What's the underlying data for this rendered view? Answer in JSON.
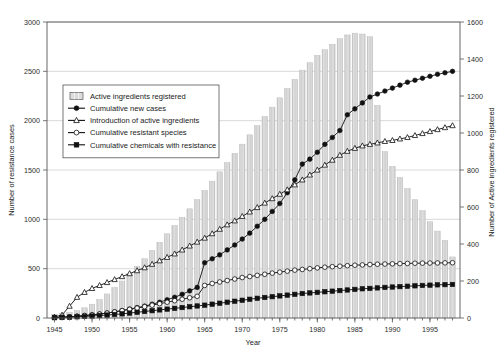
{
  "chart_data": {
    "type": "bar",
    "title": "",
    "xlabel": "Year",
    "ylabel": "Number of resistance cases",
    "y2label": "Number of Active ingredients registered",
    "xlim": [
      1944,
      1999
    ],
    "ylim": [
      0,
      3000
    ],
    "y2lim": [
      0,
      1600
    ],
    "grid": true,
    "legend_position": "upper-left-inside",
    "x_ticks": [
      "1945",
      "1950",
      "1955",
      "1960",
      "1965",
      "1970",
      "1975",
      "1980",
      "1985",
      "1990",
      "1995"
    ],
    "x_tick_values": [
      1945,
      1950,
      1955,
      1960,
      1965,
      1970,
      1975,
      1980,
      1985,
      1990,
      1995
    ],
    "y_ticks": [
      "0",
      "500",
      "1000",
      "1500",
      "2000",
      "2500",
      "3000"
    ],
    "y_tick_values": [
      0,
      500,
      1000,
      1500,
      2000,
      2500,
      3000
    ],
    "y2_ticks": [
      "0",
      "200",
      "400",
      "600",
      "800",
      "1000",
      "1200",
      "1400",
      "1600"
    ],
    "y2_tick_values": [
      0,
      200,
      400,
      600,
      800,
      1000,
      1200,
      1400,
      1600
    ],
    "x": [
      1945,
      1946,
      1947,
      1948,
      1949,
      1950,
      1951,
      1952,
      1953,
      1954,
      1955,
      1956,
      1957,
      1958,
      1959,
      1960,
      1961,
      1962,
      1963,
      1964,
      1965,
      1966,
      1967,
      1968,
      1969,
      1970,
      1971,
      1972,
      1973,
      1974,
      1975,
      1976,
      1977,
      1978,
      1979,
      1980,
      1981,
      1982,
      1983,
      1984,
      1985,
      1986,
      1987,
      1988,
      1989,
      1990,
      1991,
      1992,
      1993,
      1994,
      1995,
      1996,
      1997,
      1998
    ],
    "series": [
      {
        "name": "Active ingredients registered",
        "axis": "right",
        "marker": "bar-swatch",
        "type": "bar",
        "values": [
          20,
          25,
          30,
          40,
          55,
          75,
          100,
          130,
          165,
          200,
          240,
          280,
          320,
          365,
          410,
          455,
          500,
          545,
          590,
          640,
          690,
          740,
          790,
          840,
          890,
          940,
          990,
          1040,
          1090,
          1140,
          1190,
          1240,
          1290,
          1340,
          1380,
          1420,
          1450,
          1480,
          1510,
          1530,
          1540,
          1535,
          1520,
          1150,
          900,
          820,
          760,
          700,
          640,
          580,
          520,
          470,
          420,
          330
        ]
      },
      {
        "name": "Cumulative new cases",
        "axis": "left",
        "marker": "filled-circle",
        "type": "line",
        "values": [
          5,
          8,
          12,
          18,
          25,
          32,
          40,
          50,
          62,
          75,
          90,
          105,
          120,
          140,
          160,
          185,
          210,
          240,
          275,
          310,
          560,
          600,
          640,
          690,
          740,
          800,
          860,
          930,
          1000,
          1080,
          1160,
          1270,
          1400,
          1560,
          1610,
          1680,
          1760,
          1830,
          1900,
          2060,
          2120,
          2180,
          2240,
          2270,
          2300,
          2330,
          2360,
          2390,
          2410,
          2430,
          2450,
          2470,
          2485,
          2500
        ]
      },
      {
        "name": "Introduction of active ingredients",
        "axis": "left",
        "marker": "open-triangle",
        "type": "line",
        "values": [
          10,
          30,
          120,
          210,
          260,
          300,
          330,
          360,
          390,
          420,
          450,
          480,
          510,
          545,
          580,
          615,
          650,
          690,
          730,
          770,
          810,
          855,
          900,
          945,
          985,
          1030,
          1075,
          1120,
          1165,
          1210,
          1255,
          1300,
          1350,
          1400,
          1450,
          1500,
          1550,
          1600,
          1650,
          1690,
          1720,
          1745,
          1760,
          1775,
          1790,
          1800,
          1815,
          1830,
          1850,
          1870,
          1890,
          1910,
          1930,
          1950
        ]
      },
      {
        "name": "Cumulative resistant species",
        "axis": "left",
        "marker": "open-circle",
        "type": "line",
        "values": [
          5,
          8,
          12,
          18,
          25,
          32,
          40,
          50,
          62,
          75,
          88,
          100,
          115,
          130,
          145,
          160,
          175,
          190,
          205,
          220,
          330,
          350,
          365,
          380,
          395,
          410,
          420,
          432,
          443,
          455,
          465,
          475,
          485,
          492,
          500,
          508,
          515,
          520,
          525,
          530,
          535,
          538,
          542,
          545,
          547,
          549,
          551,
          553,
          555,
          556,
          557,
          558,
          559,
          560
        ]
      },
      {
        "name": "Cumulative chemicals with resistance",
        "axis": "left",
        "marker": "filled-square",
        "type": "line",
        "values": [
          3,
          5,
          8,
          12,
          16,
          20,
          25,
          30,
          36,
          42,
          50,
          58,
          66,
          74,
          82,
          90,
          98,
          106,
          114,
          122,
          130,
          140,
          150,
          160,
          170,
          180,
          190,
          200,
          208,
          216,
          224,
          232,
          240,
          248,
          254,
          260,
          266,
          272,
          278,
          284,
          290,
          296,
          300,
          305,
          310,
          314,
          318,
          322,
          326,
          330,
          333,
          336,
          338,
          340
        ]
      }
    ],
    "colors": {
      "bar_fill": "#c9c9c9",
      "bar_stroke": "#b0b0b0",
      "line": "#111111",
      "grid": "#bfbfbf",
      "axis": "#555555",
      "background": "#ffffff"
    }
  },
  "legend": {
    "entries": [
      {
        "label": "Active ingredients registered",
        "marker": "bar-swatch"
      },
      {
        "label": "Cumulative new cases",
        "marker": "filled-circle"
      },
      {
        "label": "Introduction of active ingredients",
        "marker": "open-triangle"
      },
      {
        "label": "Cumulative resistant species",
        "marker": "open-circle"
      },
      {
        "label": "Cumulative chemicals with resistance",
        "marker": "filled-square"
      }
    ]
  }
}
